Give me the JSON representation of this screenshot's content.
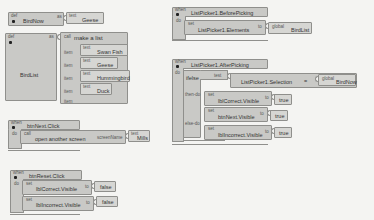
{
  "workspace": {
    "birdnow_def": {
      "kind": "def",
      "name": "BirdNow",
      "as_label": "as",
      "value_kind": "text",
      "value": "Geese"
    },
    "birdlist_def": {
      "kind": "def",
      "name": "BirdList",
      "as_label": "as",
      "call_kind": "call",
      "call": "make a list",
      "item_label": "item",
      "items": [
        {
          "kind": "text",
          "value": "Swan Fish"
        },
        {
          "kind": "text",
          "value": "Geese"
        },
        {
          "kind": "text",
          "value": "Hummingbird"
        },
        {
          "kind": "text",
          "value": "Duck"
        }
      ]
    },
    "btnNext_click": {
      "kind": "when",
      "event": "btnNext.Click",
      "do_label": "do",
      "call_kind": "call",
      "call": "open another screen",
      "param_label": "screenName",
      "param_kind": "text",
      "param_value": "Mills"
    },
    "btnReset_click": {
      "kind": "when",
      "event": "btnReset.Click",
      "do_label": "do",
      "statements": [
        {
          "kind": "set",
          "target": "lblCorrect.Visible",
          "to_label": "to",
          "value": "false"
        },
        {
          "kind": "set",
          "target": "lblIncorrect.Visible",
          "to_label": "to",
          "value": "false"
        }
      ]
    },
    "listpicker_before": {
      "kind": "when",
      "event": "ListPicker1.BeforePicking",
      "do_label": "do",
      "set_kind": "set",
      "target": "ListPicker1.Elements",
      "to_label": "to",
      "value_kind": "global",
      "value": "BirdList"
    },
    "listpicker_after": {
      "kind": "when",
      "event": "ListPicker1.AfterPicking",
      "do_label": "do",
      "ifelse_label": "ifelse",
      "test_label": "test",
      "compare_left": "ListPicker1.Selection",
      "compare_op": "=",
      "compare_right_kind": "global",
      "compare_right": "BirdNow",
      "then_label": "then-do",
      "else_label": "else-do",
      "then_statements": [
        {
          "kind": "set",
          "target": "lblCorrect.Visible",
          "to_label": "to",
          "value": "true"
        },
        {
          "kind": "set",
          "target": "btnNext.Visible",
          "to_label": "to",
          "value": "true"
        }
      ],
      "else_statements": [
        {
          "kind": "set",
          "target": "lblIncorrect.Visible",
          "to_label": "to",
          "value": "true"
        }
      ]
    }
  }
}
